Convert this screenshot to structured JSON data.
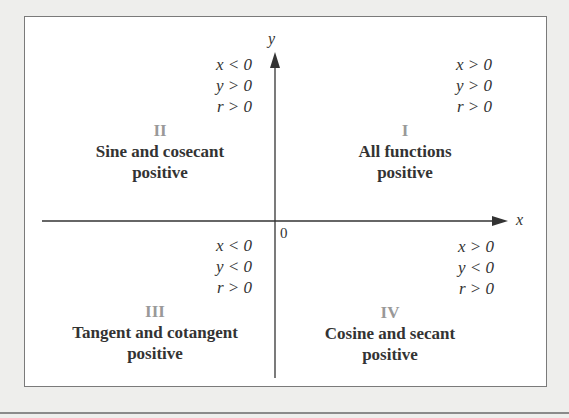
{
  "axes": {
    "x_label": "x",
    "y_label": "y",
    "origin_label": "0"
  },
  "quadrants": [
    {
      "numeral": "I",
      "title": "All functions",
      "subtitle": "positive",
      "conditions": [
        "x > 0",
        "y > 0",
        "r > 0"
      ]
    },
    {
      "numeral": "II",
      "title": "Sine and cosecant",
      "subtitle": "positive",
      "conditions": [
        "x < 0",
        "y > 0",
        "r > 0"
      ]
    },
    {
      "numeral": "III",
      "title": "Tangent and cotangent",
      "subtitle": "positive",
      "conditions": [
        "x < 0",
        "y < 0",
        "r > 0"
      ]
    },
    {
      "numeral": "IV",
      "title": "Cosine and secant",
      "subtitle": "positive",
      "conditions": [
        "x > 0",
        "y < 0",
        "r > 0"
      ]
    }
  ],
  "colors": {
    "text": "#333333",
    "numeral": "#999999",
    "border": "#7a7a7a",
    "background": "#eeeeec"
  }
}
